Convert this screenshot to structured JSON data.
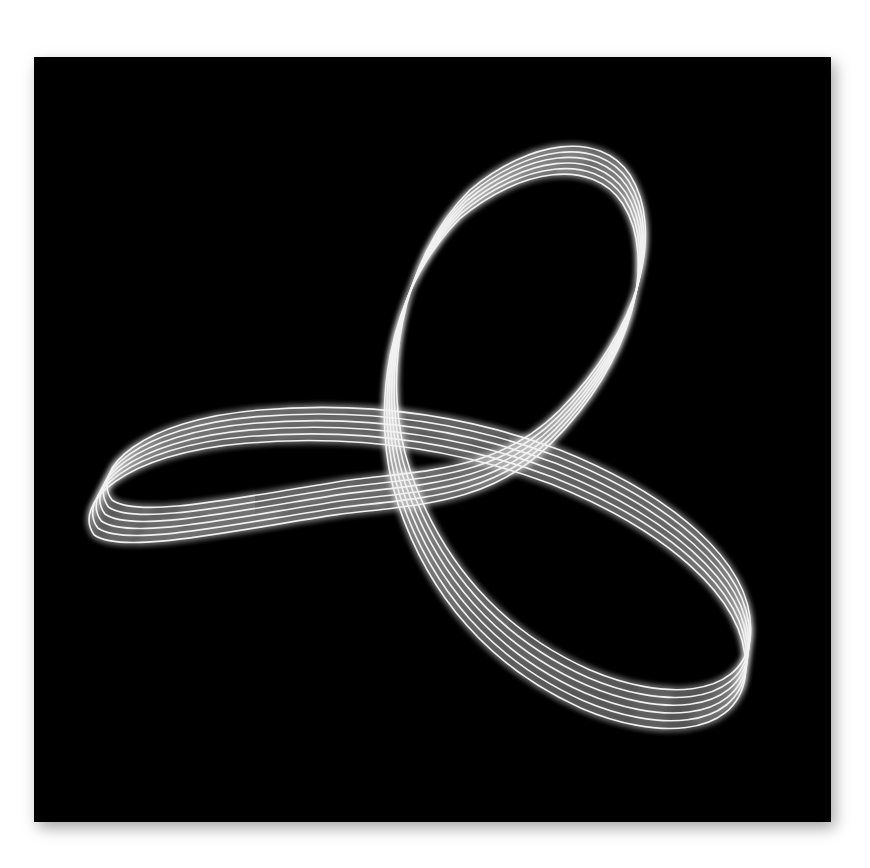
{
  "image": {
    "description": "Abstract glowing white trefoil ribbon of parallel strands on a black square",
    "background_color": "#ffffff",
    "panel_color": "#000000",
    "strand_color": "#f2f2f2",
    "strand_count": 6,
    "loops": [
      "top",
      "left",
      "bottom-right"
    ]
  }
}
